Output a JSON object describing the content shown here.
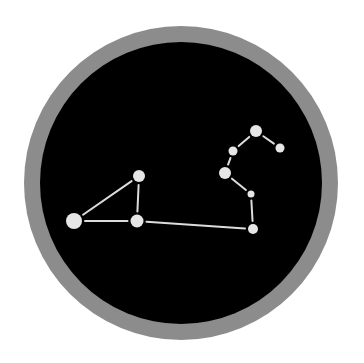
{
  "icon": {
    "name": "leo-constellation",
    "colors": {
      "background": "#ffffff",
      "ring": "#8c8c8c",
      "disc": "#000000",
      "star": "#e6e6e6",
      "line": "#dcdcdc"
    },
    "ring": {
      "cx": 181,
      "cy": 183,
      "outer_r": 157,
      "inner_r": 141
    },
    "stars": [
      {
        "id": "A",
        "x": 74,
        "y": 221,
        "r": 8
      },
      {
        "id": "B",
        "x": 139,
        "y": 176,
        "r": 6
      },
      {
        "id": "C",
        "x": 137,
        "y": 221,
        "r": 6.5
      },
      {
        "id": "D",
        "x": 253,
        "y": 229,
        "r": 5
      },
      {
        "id": "E",
        "x": 251,
        "y": 194,
        "r": 3.5
      },
      {
        "id": "F",
        "x": 225,
        "y": 173,
        "r": 6
      },
      {
        "id": "G",
        "x": 233,
        "y": 151,
        "r": 4.5
      },
      {
        "id": "H",
        "x": 256,
        "y": 131,
        "r": 6
      },
      {
        "id": "I",
        "x": 280,
        "y": 148,
        "r": 4.5
      }
    ],
    "lines": [
      {
        "from": "A",
        "to": "B"
      },
      {
        "from": "A",
        "to": "C"
      },
      {
        "from": "B",
        "to": "C"
      },
      {
        "from": "C",
        "to": "D"
      },
      {
        "from": "D",
        "to": "E"
      },
      {
        "from": "E",
        "to": "F"
      },
      {
        "from": "F",
        "to": "G"
      },
      {
        "from": "G",
        "to": "H"
      },
      {
        "from": "H",
        "to": "I"
      }
    ]
  }
}
